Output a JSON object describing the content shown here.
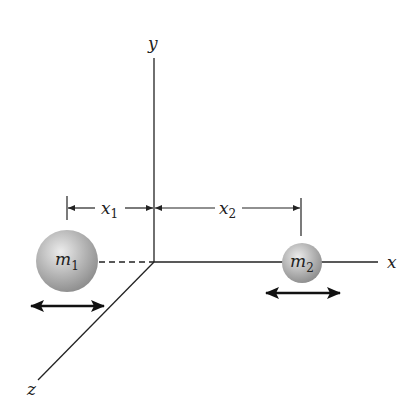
{
  "figure": {
    "axes": {
      "x_label": "x",
      "y_label": "y",
      "z_label": "z"
    },
    "masses": [
      {
        "label": "m",
        "subscript": "1"
      },
      {
        "label": "m",
        "subscript": "2"
      }
    ],
    "dimensions": [
      {
        "label": "x",
        "subscript": "1"
      },
      {
        "label": "x",
        "subscript": "2"
      }
    ],
    "colors": {
      "line": "#222222",
      "sphere_light": "#e6e6e6",
      "sphere_dark": "#8a8a8a"
    }
  }
}
